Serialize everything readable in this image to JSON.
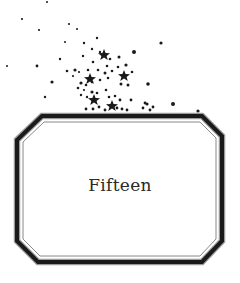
{
  "chapter": {
    "title": "Fifteen"
  },
  "ornament": {
    "icon": "star-cluster-icon",
    "color": "#1a1a1a"
  },
  "frame": {
    "icon": "octagon-frame-icon",
    "color": "#1a1a1a"
  }
}
